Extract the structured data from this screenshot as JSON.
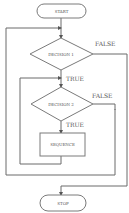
{
  "diagram": {
    "type": "flowchart",
    "nodes": {
      "start": {
        "label": "START",
        "shape": "terminator"
      },
      "decision1": {
        "label": "DECISION 1",
        "shape": "diamond"
      },
      "decision2": {
        "label": "DECISION 2",
        "shape": "diamond"
      },
      "sequence": {
        "label": "SEQUENCE",
        "shape": "process"
      },
      "stop": {
        "label": "STOP",
        "shape": "terminator"
      }
    },
    "edges": {
      "d1_true": {
        "from": "decision1",
        "to": "decision2",
        "label": "TRUE"
      },
      "d1_false": {
        "from": "decision1",
        "to": "stop",
        "label": "FALSE"
      },
      "d2_true": {
        "from": "decision2",
        "to": "sequence",
        "label": "TRUE"
      },
      "d2_false": {
        "from": "decision2",
        "to": "decision1",
        "label": "FALSE"
      },
      "seq_loop": {
        "from": "sequence",
        "to": "decision2",
        "label": ""
      }
    },
    "colors": {
      "line": "#6a6a6a",
      "text": "#555555",
      "background": "#ffffff"
    }
  }
}
